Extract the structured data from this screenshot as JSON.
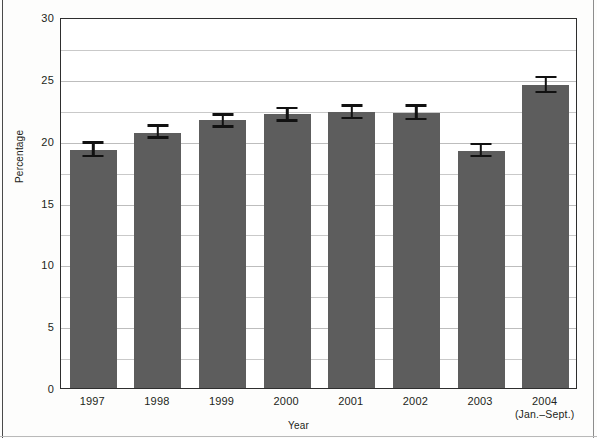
{
  "chart_data": {
    "type": "bar",
    "title": "",
    "xlabel": "Year",
    "ylabel": "Percentage",
    "categories": [
      "1997",
      "1998",
      "1999",
      "2000",
      "2001",
      "2002",
      "2003",
      "2004"
    ],
    "category_sublabels": [
      "",
      "",
      "",
      "",
      "",
      "",
      "",
      "(Jan.–Sept.)"
    ],
    "values": [
      19.4,
      20.8,
      21.8,
      22.3,
      22.5,
      22.4,
      19.3,
      24.7
    ],
    "error_upper": [
      20.1,
      21.5,
      22.4,
      22.9,
      23.1,
      23.1,
      20.0,
      25.4
    ],
    "error_lower": [
      18.8,
      20.3,
      21.2,
      21.7,
      21.9,
      21.8,
      18.8,
      24.0
    ],
    "ylim": [
      0,
      30
    ],
    "ytick_labels": [
      "0",
      "5",
      "10",
      "15",
      "20",
      "25",
      "30"
    ],
    "ytick_values": [
      0,
      5,
      10,
      15,
      20,
      25,
      30
    ],
    "minor_gridline_values": [
      2.5,
      7.5,
      12.5,
      17.5,
      22.5,
      27.5
    ],
    "grid": true,
    "legend": "none",
    "bar_color": "#5d5d5d",
    "error_color": "#111111",
    "gridline_color": "#c9c9c9",
    "axis_color": "#2e2e2e"
  }
}
